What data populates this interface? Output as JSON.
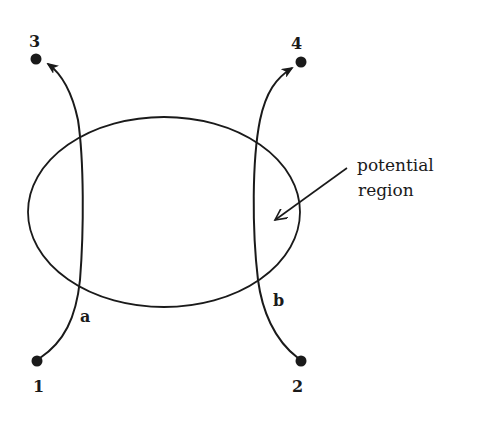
{
  "diagram": {
    "type": "scattering-paths-through-potential-region",
    "colors": {
      "ink": "#1a1a1a",
      "background": "#ffffff"
    },
    "region": {
      "label_line1": "potential",
      "label_line2": "region",
      "shape": "ellipse"
    },
    "points": [
      {
        "id": "1",
        "label": "1",
        "role": "start"
      },
      {
        "id": "2",
        "label": "2",
        "role": "start"
      },
      {
        "id": "3",
        "label": "3",
        "role": "end"
      },
      {
        "id": "4",
        "label": "4",
        "role": "end"
      }
    ],
    "paths": [
      {
        "id": "a",
        "label": "a",
        "from": "1",
        "to": "3"
      },
      {
        "id": "b",
        "label": "b",
        "from": "2",
        "to": "4"
      }
    ]
  }
}
